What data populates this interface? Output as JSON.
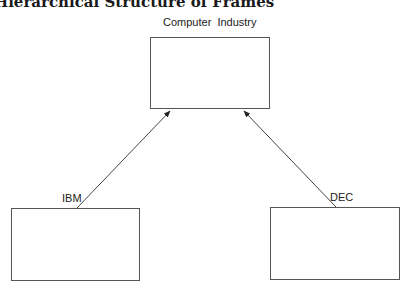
{
  "title": "Hierarchical Structure of Frames",
  "nodes": {
    "root": {
      "label": "Computer  Industry"
    },
    "left": {
      "label": "IBM"
    },
    "right": {
      "label": "DEC"
    }
  },
  "edges": [
    {
      "from": "IBM",
      "to": "Computer Industry"
    },
    {
      "from": "DEC",
      "to": "Computer Industry"
    }
  ]
}
